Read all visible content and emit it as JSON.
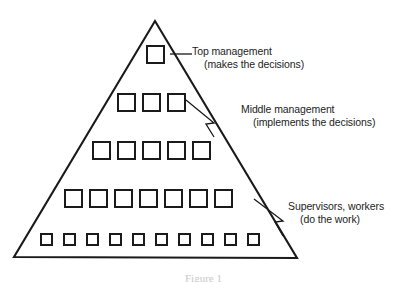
{
  "figure": {
    "type": "organizational-pyramid",
    "caption": "Figure 1",
    "background_color": "#ffffff",
    "line_color": "#1a1a1a"
  },
  "pyramid": {
    "apex": {
      "x": 155,
      "y": 21
    },
    "bottom_left": {
      "x": 14,
      "y": 257
    },
    "bottom_right": {
      "x": 297,
      "y": 258
    },
    "levels": [
      {
        "level": 1,
        "name": "top-management",
        "square_count": 1,
        "square_size": 17,
        "row_y": 46,
        "start_x": 147,
        "gap": 25
      },
      {
        "level": 2,
        "name": "middle-management-upper",
        "square_count": 3,
        "square_size": 17,
        "row_y": 94,
        "start_x": 118,
        "gap": 25
      },
      {
        "level": 3,
        "name": "middle-management-lower",
        "square_count": 5,
        "square_size": 17,
        "row_y": 142,
        "start_x": 93,
        "gap": 25
      },
      {
        "level": 4,
        "name": "supervisors",
        "square_count": 7,
        "square_size": 17,
        "row_y": 190,
        "start_x": 65,
        "gap": 25
      },
      {
        "level": 5,
        "name": "workers",
        "square_count": 10,
        "square_size": 11,
        "row_y": 234,
        "start_x": 41,
        "gap": 23
      }
    ],
    "total_squares": 26
  },
  "annotations": [
    {
      "id": "top",
      "title": "Top management",
      "subtitle": "(makes the decisions)",
      "leader": {
        "style": "straight",
        "from_x": 174,
        "from_y": 54,
        "to_x": 192,
        "to_y": 54
      }
    },
    {
      "id": "middle",
      "title": "Middle management",
      "subtitle": "(implements the decisions)",
      "leader": {
        "style": "bent-arrow",
        "from_x": 186,
        "from_y": 100,
        "to_x": 238,
        "to_y": 110
      }
    },
    {
      "id": "supervisors",
      "title": "Supervisors, workers",
      "subtitle": "(do the work)",
      "leader": {
        "style": "bent-arrow",
        "from_x": 255,
        "from_y": 199,
        "to_x": 285,
        "to_y": 208
      }
    }
  ]
}
